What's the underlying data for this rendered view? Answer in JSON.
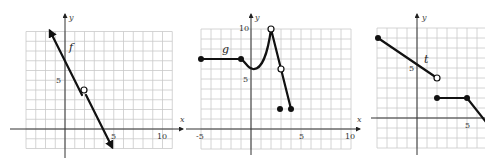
{
  "chart_data": [
    {
      "type": "line",
      "title": "",
      "function_label": "f",
      "xlabel": "x",
      "ylabel": "y",
      "x_ticks": [
        "5",
        "10"
      ],
      "y_ticks": [
        "5"
      ],
      "xlim": [
        -4,
        11
      ],
      "ylim": [
        -2,
        10
      ],
      "grid": true,
      "series": [
        {
          "name": "f",
          "kind": "line-with-arrows",
          "points": [
            [
              -1.6,
              11.2
            ],
            [
              5,
              -2
            ]
          ],
          "equation": "y = -2x + 8"
        }
      ],
      "open_points": [
        [
          2,
          4
        ]
      ],
      "filled_points": []
    },
    {
      "type": "line",
      "title": "",
      "function_label": "g",
      "xlabel": "x",
      "ylabel": "y",
      "x_ticks": [
        "-5",
        "5",
        "10"
      ],
      "y_ticks": [
        "5",
        "10"
      ],
      "xlim": [
        -5,
        10
      ],
      "ylim": [
        -2,
        10
      ],
      "grid": true,
      "series": [
        {
          "name": "g-flat",
          "points": [
            [
              -5,
              7
            ],
            [
              -1,
              7
            ]
          ]
        },
        {
          "name": "g-curve",
          "points": [
            [
              -1,
              7
            ],
            [
              0,
              6
            ],
            [
              1,
              6.8
            ],
            [
              2,
              10
            ]
          ]
        },
        {
          "name": "g-line",
          "points": [
            [
              2,
              10
            ],
            [
              3,
              6
            ],
            [
              4,
              2
            ]
          ]
        }
      ],
      "open_points": [
        [
          2,
          10
        ],
        [
          3,
          6
        ]
      ],
      "filled_points": [
        [
          -5,
          7
        ],
        [
          -1,
          7
        ],
        [
          3,
          2
        ],
        [
          4,
          2
        ]
      ]
    },
    {
      "type": "line",
      "title": "",
      "function_label": "t",
      "xlabel": "x",
      "ylabel": "y",
      "x_ticks": [
        "5"
      ],
      "y_ticks": [
        "5"
      ],
      "xlim": [
        -4,
        7
      ],
      "ylim": [
        -3,
        9
      ],
      "grid": true,
      "series": [
        {
          "name": "t-upper",
          "points": [
            [
              -4,
              8
            ],
            [
              2,
              4
            ]
          ]
        },
        {
          "name": "t-lower",
          "points": [
            [
              2,
              2
            ],
            [
              5,
              2
            ],
            [
              7,
              -0.5
            ]
          ]
        }
      ],
      "open_points": [
        [
          2,
          4
        ]
      ],
      "filled_points": [
        [
          -4,
          8
        ],
        [
          2,
          2
        ],
        [
          5,
          2
        ]
      ]
    }
  ],
  "labels": {
    "g1": {
      "func": "f",
      "x": "x",
      "y": "y",
      "tick_x5": "5",
      "tick_x10": "10",
      "tick_y5": "5"
    },
    "g2": {
      "func": "g",
      "x": "x",
      "y": "y",
      "tick_xm5": "-5",
      "tick_x5": "5",
      "tick_x10": "10",
      "tick_y5": "5",
      "tick_y10": "10"
    },
    "g3": {
      "func": "t",
      "x": "x",
      "y": "y",
      "tick_x5": "5",
      "tick_y5": "5"
    }
  }
}
